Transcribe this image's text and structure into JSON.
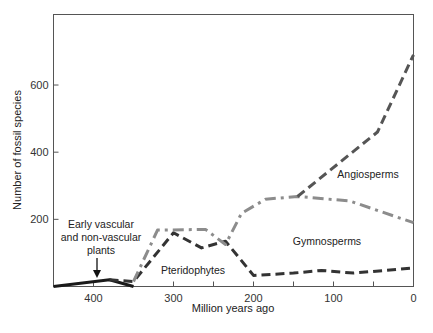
{
  "chart_data": {
    "type": "line",
    "title": "",
    "xlabel": "Million years ago",
    "ylabel": "Number of fossil species",
    "xlim": [
      450,
      0
    ],
    "ylim": [
      0,
      810
    ],
    "x_reversed": true,
    "grid": false,
    "legend": "none (series labeled inline)",
    "x_ticks": [
      400,
      300,
      200,
      100,
      0
    ],
    "x_tick_labels": [
      "400",
      "300",
      "200",
      "100",
      "0"
    ],
    "y_ticks": [
      200,
      400,
      600
    ],
    "y_tick_labels": [
      "200",
      "400",
      "600"
    ],
    "series": [
      {
        "name": "Early vascular and non-vascular plants",
        "style": "solid",
        "color": "#1a1a1a",
        "points": [
          [
            450,
            0
          ],
          [
            380,
            20
          ],
          [
            350,
            0
          ]
        ]
      },
      {
        "name": "Pteridophytes",
        "style": "dashed",
        "color": "#333333",
        "points": [
          [
            380,
            20
          ],
          [
            350,
            15
          ],
          [
            300,
            160
          ],
          [
            265,
            115
          ],
          [
            235,
            135
          ],
          [
            200,
            33
          ],
          [
            150,
            40
          ],
          [
            115,
            48
          ],
          [
            75,
            40
          ],
          [
            0,
            55
          ]
        ]
      },
      {
        "name": "Gymnosperms",
        "style": "dash-dot",
        "color": "#8c8c8c",
        "points": [
          [
            350,
            15
          ],
          [
            320,
            168
          ],
          [
            260,
            170
          ],
          [
            235,
            125
          ],
          [
            215,
            218
          ],
          [
            185,
            260
          ],
          [
            145,
            268
          ],
          [
            80,
            255
          ],
          [
            0,
            190
          ]
        ]
      },
      {
        "name": "Angiosperms",
        "style": "dashed",
        "color": "#555555",
        "points": [
          [
            145,
            268
          ],
          [
            45,
            460
          ],
          [
            0,
            690
          ]
        ]
      }
    ],
    "annotations": [
      {
        "text": [
          "Early vascular",
          "and non-vascular",
          "plants"
        ],
        "arrow_to": [
          395,
          20
        ]
      },
      {
        "text": [
          "Pteridophytes"
        ],
        "at": [
          285,
          45
        ]
      },
      {
        "text": [
          "Gymnosperms"
        ],
        "at": [
          110,
          130
        ]
      },
      {
        "text": [
          "Angiosperms"
        ],
        "at": [
          40,
          310
        ]
      }
    ]
  },
  "labels": {
    "xlabel": "Million years ago",
    "ylabel": "Number of fossil species",
    "early_1": "Early vascular",
    "early_2": "and non-vascular",
    "early_3": "plants",
    "pterido": "Pteridophytes",
    "gymno": "Gymnosperms",
    "angio": "Angiosperms"
  }
}
